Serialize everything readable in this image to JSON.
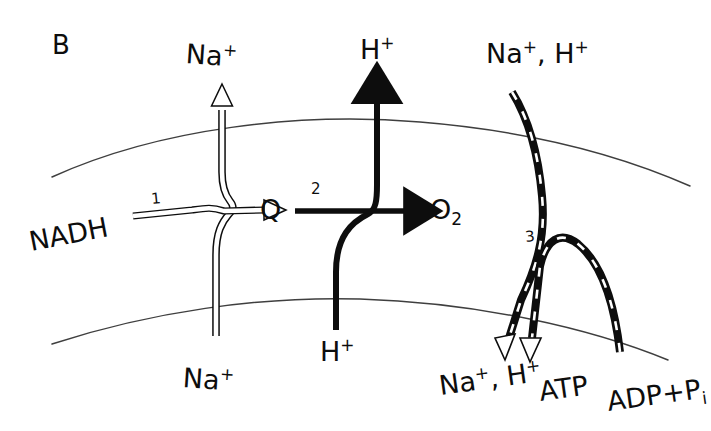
{
  "figure": {
    "panel_letter": "B",
    "background_color": "#ffffff",
    "ink_color": "#0d0d0d",
    "membrane_color": "#3a3a3a",
    "width": 711,
    "height": 431
  },
  "membrane": {
    "name": "cell-membrane",
    "upper_line_label": "upper-membrane-boundary",
    "lower_line_label": "lower-membrane-boundary"
  },
  "complexes": [
    {
      "id": "1",
      "number": "1",
      "name": "complex-1-nadh-dehydrogenase"
    },
    {
      "id": "2",
      "number": "2",
      "name": "complex-2-quinol-oxidase"
    },
    {
      "id": "3",
      "number": "3",
      "name": "complex-3-atp-synthase"
    }
  ],
  "labels": {
    "na_top_left": {
      "text": "Na",
      "sup": "+",
      "sub": ""
    },
    "na_bottom_left": {
      "text": "Na",
      "sup": "+",
      "sub": ""
    },
    "nadh": {
      "text": "NADH",
      "sup": "",
      "sub": ""
    },
    "quinone": {
      "text": "Q",
      "sup": "",
      "sub": ""
    },
    "h_top": {
      "text": "H",
      "sup": "+",
      "sub": ""
    },
    "h_bottom": {
      "text": "H",
      "sup": "+",
      "sub": ""
    },
    "oxygen": {
      "text": "O",
      "sup": "",
      "sub": "2"
    },
    "na_h_top": {
      "na": "Na",
      "na_sup": "+",
      "comma": ",",
      "h": "H",
      "h_sup": "+"
    },
    "na_h_bottom": {
      "na": "Na",
      "na_sup": "+",
      "comma": ",",
      "h": "H",
      "h_sup": "+"
    },
    "atp": {
      "text": "ATP",
      "sup": "",
      "sub": ""
    },
    "adp_pi": {
      "text": "ADP",
      "plus": "+",
      "p": "P",
      "sub": "i"
    }
  },
  "arrows": {
    "na_efflux": {
      "name": "na-efflux-arrow",
      "style": "outline",
      "direction": "up"
    },
    "nadh_to_q": {
      "name": "nadh-to-quinone-arrow",
      "style": "outline",
      "direction": "right"
    },
    "q_to_o2": {
      "name": "quinone-to-oxygen-arrow",
      "style": "solid",
      "direction": "right"
    },
    "h_translocation": {
      "name": "proton-translocation-arrow",
      "style": "solid",
      "direction": "up"
    },
    "cation_influx": {
      "name": "cation-influx-arrow",
      "style": "dashed-black",
      "direction": "down"
    },
    "atp_synthesis": {
      "name": "atp-synthesis-arrow",
      "style": "dashed-black",
      "direction": "down"
    }
  }
}
